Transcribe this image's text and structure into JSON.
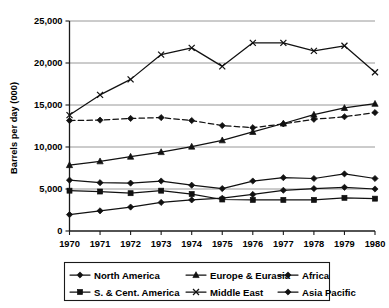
{
  "chart_data": {
    "type": "line",
    "title": "",
    "subtitle": "",
    "xlabel": "",
    "ylabel": "Barrels per day (000)",
    "grid": "horizontal",
    "legend_position": "bottom",
    "x": [
      1970,
      1971,
      1972,
      1973,
      1974,
      1975,
      1976,
      1977,
      1978,
      1979,
      1980
    ],
    "categories": [
      "1970",
      "1971",
      "1972",
      "1973",
      "1974",
      "1975",
      "1976",
      "1977",
      "1978",
      "1979",
      "1980"
    ],
    "xlim": [
      1970,
      1980
    ],
    "ylim": [
      0,
      25000
    ],
    "yticks": [
      0,
      5000,
      10000,
      15000,
      20000,
      25000
    ],
    "ytick_labels": [
      "0",
      "5,000",
      "10,000",
      "15,000",
      "20,000",
      "25,000"
    ],
    "series": [
      {
        "name": "North America",
        "marker": "diamond",
        "linestyle": "dashed",
        "values": [
          13150,
          13200,
          13400,
          13500,
          13150,
          12550,
          12300,
          12750,
          13300,
          13600,
          14100
        ]
      },
      {
        "name": "S. & Cent. America",
        "marker": "square",
        "linestyle": "solid",
        "values": [
          4800,
          4700,
          4500,
          4800,
          4400,
          3750,
          3700,
          3700,
          3700,
          3950,
          3850
        ]
      },
      {
        "name": "Europe & Eurasia",
        "marker": "triangle",
        "linestyle": "solid",
        "values": [
          7850,
          8300,
          8850,
          9400,
          10050,
          10800,
          11800,
          12800,
          13850,
          14650,
          15150
        ]
      },
      {
        "name": "Middle East",
        "marker": "x",
        "linestyle": "solid",
        "values": [
          13800,
          16200,
          18050,
          21000,
          21800,
          19600,
          22400,
          22400,
          21450,
          22050,
          18900
        ]
      },
      {
        "name": "Africa",
        "marker": "diamond",
        "linestyle": "solid",
        "values": [
          6050,
          5750,
          5700,
          5950,
          5450,
          5050,
          5950,
          6350,
          6250,
          6800,
          6250
        ]
      },
      {
        "name": "Asia Pacific",
        "marker": "diamond",
        "linestyle": "solid",
        "values": [
          1950,
          2400,
          2850,
          3400,
          3700,
          3900,
          4350,
          4850,
          5050,
          5200,
          5000
        ]
      }
    ],
    "legend": [
      {
        "label": "North America",
        "marker": "diamond",
        "linestyle": "dashed"
      },
      {
        "label": "Europe & Eurasia",
        "marker": "triangle",
        "linestyle": "solid"
      },
      {
        "label": "Africa",
        "marker": "diamond",
        "linestyle": "solid"
      },
      {
        "label": "S. & Cent. America",
        "marker": "square",
        "linestyle": "solid"
      },
      {
        "label": "Middle East",
        "marker": "x",
        "linestyle": "solid"
      },
      {
        "label": "Asia Pacific",
        "marker": "diamond",
        "linestyle": "solid"
      }
    ],
    "colors": {
      "line": "#111111",
      "grid": "#8c8c8c",
      "axis": "#1a1a1a",
      "background": "#ffffff"
    }
  }
}
